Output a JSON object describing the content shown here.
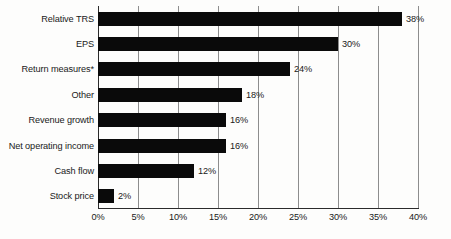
{
  "chart_data": {
    "type": "bar",
    "orientation": "horizontal",
    "title": "",
    "subtitle": "",
    "xlabel": "",
    "ylabel": "",
    "xlim": [
      0,
      40
    ],
    "xtick_step": 5,
    "grid": true,
    "legend": null,
    "categories": [
      "Relative TRS",
      "EPS",
      "Return measures*",
      "Other",
      "Revenue growth",
      "Net operating income",
      "Cash flow",
      "Stock price"
    ],
    "values": [
      38,
      30,
      24,
      18,
      16,
      16,
      12,
      2
    ],
    "value_labels": [
      "38%",
      "30%",
      "24%",
      "18%",
      "16%",
      "16%",
      "12%",
      "2%"
    ],
    "tick_labels": [
      "0%",
      "5%",
      "10%",
      "15%",
      "20%",
      "25%",
      "30%",
      "35%",
      "40%"
    ],
    "tick_values": [
      0,
      5,
      10,
      15,
      20,
      25,
      30,
      35,
      40
    ],
    "colors": {
      "bar": "#0a0a0a",
      "grid": "#8d8d8d",
      "axis": "#2b2b2b",
      "text": "#1a1a1a",
      "background": "#fdfdfc"
    }
  }
}
